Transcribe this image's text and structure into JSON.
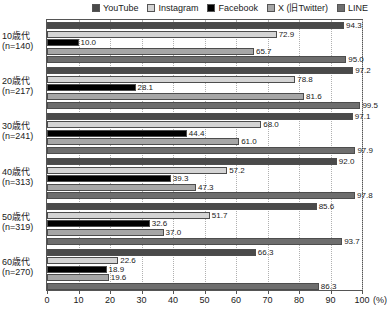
{
  "chart_data": {
    "type": "bar",
    "orientation": "horizontal",
    "title": "",
    "xlabel": "(%)",
    "ylabel": "",
    "xlim": [
      0,
      100
    ],
    "xticks": [
      0,
      10,
      20,
      30,
      40,
      50,
      60,
      70,
      80,
      90,
      100
    ],
    "xtick_labels": [
      "0",
      "10",
      "20",
      "30",
      "40",
      "50",
      "60",
      "70",
      "80",
      "90",
      "100"
    ],
    "x_unit_label": "(%)",
    "grid": true,
    "grid_axis": "x",
    "legend_position": "top-right",
    "categories": [
      "10歳代\n(n=140)",
      "20歳代\n(n=217)",
      "30歳代\n(n=241)",
      "40歳代\n(n=313)",
      "50歳代\n(n=319)",
      "60歳代\n(n=270)"
    ],
    "category_lines": [
      {
        "line1": "10歳代",
        "line2": "(n=140)"
      },
      {
        "line1": "20歳代",
        "line2": "(n=217)"
      },
      {
        "line1": "30歳代",
        "line2": "(n=241)"
      },
      {
        "line1": "40歳代",
        "line2": "(n=313)"
      },
      {
        "line1": "50歳代",
        "line2": "(n=319)"
      },
      {
        "line1": "60歳代",
        "line2": "(n=270)"
      }
    ],
    "series": [
      {
        "name": "YouTube",
        "color": "#4a4a4a",
        "values": [
          94.3,
          97.2,
          97.1,
          92.0,
          85.6,
          66.3
        ],
        "labels": [
          "94.3",
          "97.2",
          "97.1",
          "92.0",
          "85.6",
          "66.3"
        ]
      },
      {
        "name": "Instagram",
        "color": "#d4d4d4",
        "values": [
          72.9,
          78.8,
          68.0,
          57.2,
          51.7,
          22.6
        ],
        "labels": [
          "72.9",
          "78.8",
          "68.0",
          "57.2",
          "51.7",
          "22.6"
        ]
      },
      {
        "name": "Facebook",
        "color": "#000000",
        "values": [
          10.0,
          28.1,
          44.4,
          39.3,
          32.6,
          18.9
        ],
        "labels": [
          "10.0",
          "28.1",
          "44.4",
          "39.3",
          "32.6",
          "18.9"
        ]
      },
      {
        "name": "X (旧Twitter)",
        "color": "#a6a6a6",
        "values": [
          65.7,
          81.6,
          61.0,
          47.3,
          37.0,
          19.6
        ],
        "labels": [
          "65.7",
          "81.6",
          "61.0",
          "47.3",
          "37.0",
          "19.6"
        ]
      },
      {
        "name": "LINE",
        "color": "#6e6e6e",
        "values": [
          95.0,
          99.5,
          97.9,
          97.8,
          93.7,
          86.3
        ],
        "labels": [
          "95.0",
          "99.5",
          "97.9",
          "97.8",
          "93.7",
          "86.3"
        ]
      }
    ]
  },
  "legend": {
    "items": [
      {
        "label": "YouTube",
        "color": "#4a4a4a"
      },
      {
        "label": "Instagram",
        "color": "#d4d4d4"
      },
      {
        "label": "Facebook",
        "color": "#000000"
      },
      {
        "label": "X (旧Twitter)",
        "color": "#a6a6a6"
      },
      {
        "label": "LINE",
        "color": "#6e6e6e"
      }
    ]
  }
}
